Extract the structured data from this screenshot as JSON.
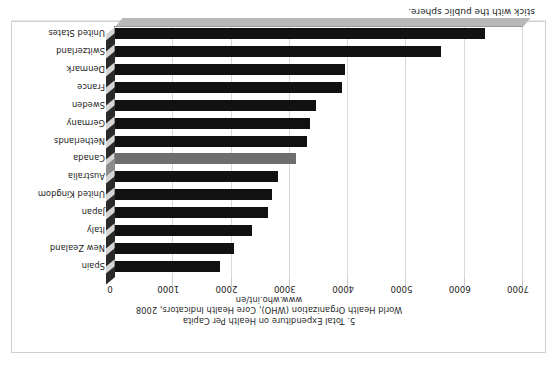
{
  "page": {
    "running_text": "stick with the public sphere."
  },
  "caption": {
    "line1": "5. Total Expenditure on Health Per Capita",
    "line2": "World Health Organization (WHO), Core Health Indicators, 2008",
    "line3": "www.who.int/en"
  },
  "chart_data": {
    "type": "bar",
    "orientation": "horizontal",
    "title": "5. Total Expenditure on Health Per Capita",
    "subtitle": "World Health Organization (WHO), Core Health Indicators, 2008",
    "source": "www.who.int/en",
    "xlabel": "",
    "ylabel": "",
    "xlim": [
      0,
      7000
    ],
    "grid": true,
    "legend": "none",
    "highlight_category": "Canada",
    "colors": {
      "bar": "#111111",
      "highlight_bar": "#6e6e6e",
      "gridline": "#d9d9d9",
      "axis": "#9a9a9a"
    },
    "tick_values": [
      0,
      1000,
      2000,
      3000,
      4000,
      5000,
      6000,
      7000
    ],
    "tick_labels": [
      "0",
      "1000",
      "2000",
      "3000",
      "4000",
      "5000",
      "6000",
      "7000"
    ],
    "categories": [
      "Spain",
      "New Zealand",
      "Italy",
      "Japan",
      "United Kingdom",
      "Australia",
      "Canada",
      "Netherlands",
      "Germany",
      "Sweden",
      "France",
      "Denmark",
      "Switzerland",
      "United States"
    ],
    "values": [
      1800,
      2040,
      2350,
      2620,
      2700,
      2800,
      3100,
      3300,
      3350,
      3450,
      3900,
      3950,
      5600,
      6350
    ]
  }
}
